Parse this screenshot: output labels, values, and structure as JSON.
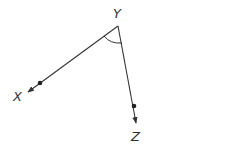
{
  "diagram": {
    "type": "angle",
    "vertex": {
      "label": "Y",
      "x": 118,
      "y": 26
    },
    "rays": [
      {
        "label": "X",
        "point": {
          "x": 40,
          "y": 83
        },
        "arrow_tip": {
          "x": 27,
          "y": 93
        }
      },
      {
        "label": "Z",
        "point": {
          "x": 134,
          "y": 106
        },
        "arrow_tip": {
          "x": 136,
          "y": 124
        }
      }
    ],
    "angle_marker": "arc",
    "stroke_color": "#333333"
  },
  "labels": {
    "vertex": "Y",
    "ray1": "X",
    "ray2": "Z"
  }
}
